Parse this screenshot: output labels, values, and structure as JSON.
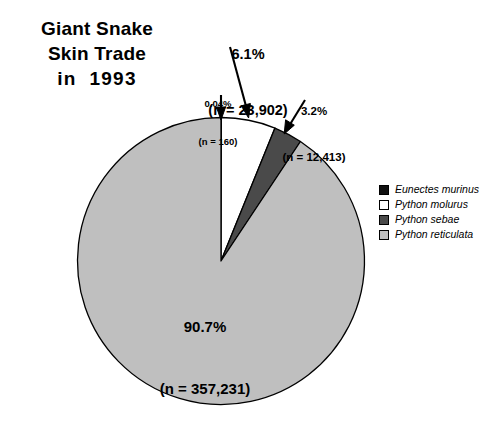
{
  "title": {
    "line1": "Giant Snake",
    "line2": "Skin Trade",
    "line3": "in  1993"
  },
  "chart_data": {
    "type": "pie",
    "title": "Giant Snake Skin Trade in 1993",
    "total": 393706,
    "start_angle_deg": 0,
    "direction": "clockwise",
    "legend_position": "right",
    "categories": [
      "Eunectes murinus",
      "Python molurus",
      "Python sebae",
      "Python reticulata"
    ],
    "values": [
      0.04,
      6.1,
      3.2,
      90.7
    ],
    "counts": [
      160,
      23902,
      12413,
      357231
    ],
    "count_labels": [
      "160",
      "23,902",
      "12,413",
      "357,231"
    ],
    "percent_labels": [
      "0.04%",
      "6.1%",
      "3.2%",
      "90.7%"
    ],
    "colors": [
      "#111111",
      "#ffffff",
      "#4a4a4a",
      "#bfbfbf"
    ],
    "slices": [
      {
        "name": "Eunectes murinus",
        "percent": 0.04,
        "percent_label": "0.04%",
        "count": 160,
        "count_label": "(n = 160)",
        "color": "#111111"
      },
      {
        "name": "Python molurus",
        "percent": 6.1,
        "percent_label": "6.1%",
        "count": 23902,
        "count_label": "(n = 23,902)",
        "color": "#ffffff"
      },
      {
        "name": "Python sebae",
        "percent": 3.2,
        "percent_label": "3.2%",
        "count": 12413,
        "count_label": "(n = 12,413)",
        "color": "#4a4a4a"
      },
      {
        "name": "Python reticulata",
        "percent": 90.7,
        "percent_label": "90.7%",
        "count": 357231,
        "count_label": "(n = 357,231)",
        "color": "#bfbfbf"
      }
    ]
  },
  "callouts": {
    "murinus": {
      "percent": "0.04%",
      "count": "(n = 160)"
    },
    "molurus": {
      "percent": "6.1%",
      "count": "(n = 23,902)"
    },
    "sebae": {
      "percent": "3.2%",
      "count": "(n = 12,413)"
    }
  },
  "slice_label": {
    "percent": "90.7%",
    "count": "(n = 357,231)"
  },
  "legend": {
    "items": [
      {
        "label": "Eunectes murinus",
        "color": "#111111"
      },
      {
        "label": "Python molurus",
        "color": "#ffffff"
      },
      {
        "label": "Python sebae",
        "color": "#4a4a4a"
      },
      {
        "label": "Python reticulata",
        "color": "#bfbfbf"
      }
    ]
  },
  "style": {
    "background": "#ffffff",
    "outline": "#000000"
  }
}
